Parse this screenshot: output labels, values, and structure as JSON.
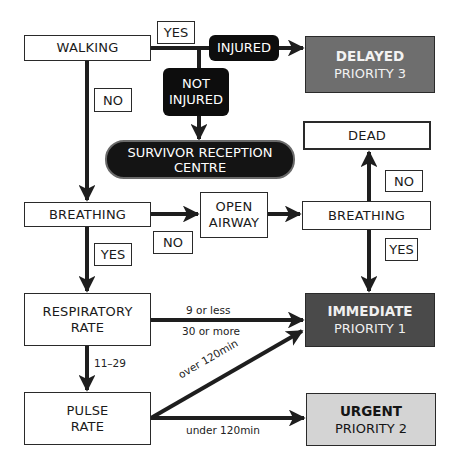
{
  "colors": {
    "line": "#1e1e1e",
    "delayed_bg": "#6e6e6e",
    "immediate_bg": "#4a4a4a",
    "urgent_bg": "#d4d4d4",
    "black_node": "#0d0d0d"
  },
  "nodes": {
    "walking": "WALKING",
    "injured": "INJURED",
    "not_injured": [
      "NOT",
      "INJURED"
    ],
    "survivor_centre": [
      "SURVIVOR RECEPTION",
      "CENTRE"
    ],
    "delayed": {
      "title": "DELAYED",
      "sub": "PRIORITY 3"
    },
    "dead": "DEAD",
    "breathing_1": "BREATHING",
    "open_airway": [
      "OPEN",
      "AIRWAY"
    ],
    "breathing_2": "BREATHING",
    "respiratory_rate": [
      "RESPIRATORY",
      "RATE"
    ],
    "immediate": {
      "title": "IMMEDIATE",
      "sub": "PRIORITY 1"
    },
    "pulse_rate": [
      "PULSE",
      "RATE"
    ],
    "urgent": {
      "title": "URGENT",
      "sub": "PRIORITY 2"
    }
  },
  "decision_labels": {
    "walking_yes": "YES",
    "walking_no": "NO",
    "breathing_1_yes": "YES",
    "breathing_1_no": "NO",
    "breathing_2_no": "NO",
    "breathing_2_yes": "YES"
  },
  "edge_labels": {
    "resp_low": "9 or less",
    "resp_high": "30 or more",
    "resp_normal": "11–29",
    "pulse_over": "over 120min",
    "pulse_under": "under 120min"
  }
}
